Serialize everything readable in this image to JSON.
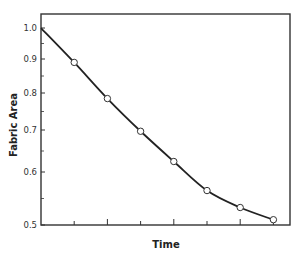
{
  "chart_data": {
    "type": "line",
    "title": "",
    "xlabel": "Time",
    "ylabel": "Fabric Area",
    "yscale": "log",
    "ylim": [
      0.5,
      1.0
    ],
    "yticks": [
      "1.0",
      "0.9",
      "0.8",
      "0.7",
      "0.6",
      "0.5"
    ],
    "ytick_values": [
      1.0,
      0.9,
      0.8,
      0.7,
      0.6,
      0.5
    ],
    "xticks_count": 7,
    "xtick_labels": [],
    "grid": false,
    "legend": null,
    "series": [
      {
        "name": "Fabric Area",
        "marker": "open-circle",
        "x": [
          1,
          2,
          3,
          4,
          5,
          6,
          7
        ],
        "values": [
          0.89,
          0.785,
          0.697,
          0.625,
          0.565,
          0.533,
          0.51
        ]
      }
    ],
    "curve_start": {
      "x": 0,
      "y": 1.0
    }
  }
}
